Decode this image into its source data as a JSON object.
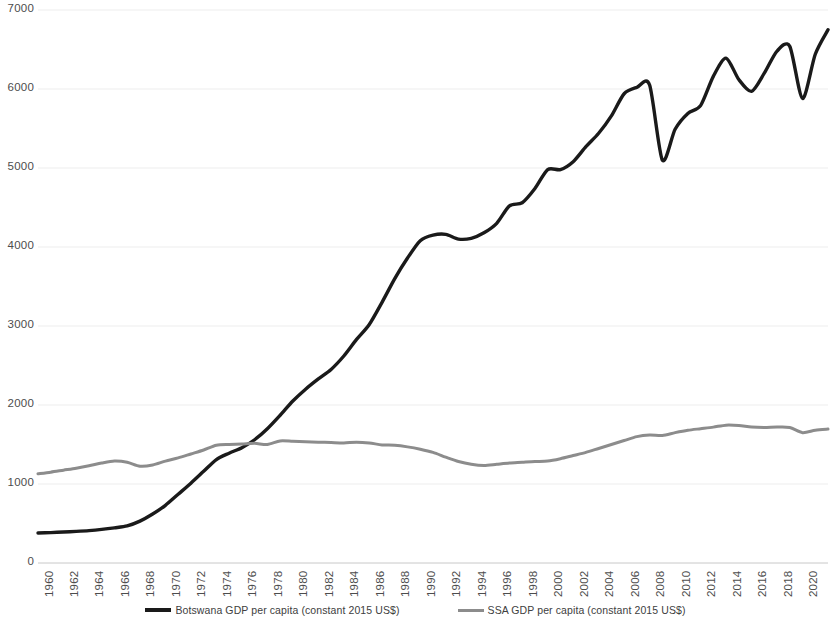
{
  "chart_data": {
    "type": "line",
    "title": "",
    "xlabel": "",
    "ylabel": "",
    "xlim": [
      1960,
      2022
    ],
    "ylim": [
      0,
      7000
    ],
    "grid": true,
    "legend_position": "bottom",
    "yticks": [
      0,
      1000,
      2000,
      3000,
      4000,
      5000,
      6000,
      7000
    ],
    "ytick_labels": [
      "0",
      "1000",
      "2000",
      "3000",
      "4000",
      "5000",
      "6000",
      "7000"
    ],
    "xticks": [
      1960,
      1962,
      1964,
      1966,
      1968,
      1970,
      1972,
      1974,
      1976,
      1978,
      1980,
      1982,
      1984,
      1986,
      1988,
      1990,
      1992,
      1994,
      1996,
      1998,
      2000,
      2002,
      2004,
      2006,
      2008,
      2010,
      2012,
      2014,
      2016,
      2018,
      2020,
      2022
    ],
    "xtick_labels": [
      "1960",
      "1962",
      "1964",
      "1966",
      "1968",
      "1970",
      "1972",
      "1974",
      "1976",
      "1978",
      "1980",
      "1982",
      "1984",
      "1986",
      "1988",
      "1990",
      "1992",
      "1994",
      "1996",
      "1998",
      "2000",
      "2002",
      "2004",
      "2006",
      "2008",
      "2010",
      "2012",
      "2014",
      "2016",
      "2018",
      "2020",
      "2022"
    ],
    "x": [
      1960,
      1961,
      1962,
      1963,
      1964,
      1965,
      1966,
      1967,
      1968,
      1969,
      1970,
      1971,
      1972,
      1973,
      1974,
      1975,
      1976,
      1977,
      1978,
      1979,
      1980,
      1981,
      1982,
      1983,
      1984,
      1985,
      1986,
      1987,
      1988,
      1989,
      1990,
      1991,
      1992,
      1993,
      1994,
      1995,
      1996,
      1997,
      1998,
      1999,
      2000,
      2001,
      2002,
      2003,
      2004,
      2005,
      2006,
      2007,
      2008,
      2009,
      2010,
      2011,
      2012,
      2013,
      2014,
      2015,
      2016,
      2017,
      2018,
      2019,
      2020,
      2021,
      2022
    ],
    "series": [
      {
        "name": "Botswana GDP per capita (constant 2015 US$)",
        "color": "#1a1a1a",
        "width": 3.4,
        "values": [
          380,
          385,
          392,
          400,
          410,
          425,
          445,
          470,
          530,
          620,
          730,
          870,
          1010,
          1160,
          1310,
          1390,
          1460,
          1560,
          1700,
          1870,
          2050,
          2200,
          2330,
          2450,
          2620,
          2830,
          3020,
          3300,
          3600,
          3860,
          4080,
          4150,
          4160,
          4100,
          4110,
          4180,
          4300,
          4520,
          4560,
          4740,
          4980,
          4980,
          5080,
          5270,
          5440,
          5660,
          5940,
          6020,
          6050,
          5100,
          5490,
          5690,
          5790,
          6160,
          6390,
          6120,
          5970,
          6200,
          6480,
          6540,
          5880,
          6440,
          6750
        ]
      },
      {
        "name": "SSA GDP per capita (constant 2015 US$)",
        "color": "#8c8c8c",
        "width": 3.0,
        "values": [
          1130,
          1150,
          1175,
          1200,
          1230,
          1265,
          1290,
          1275,
          1225,
          1240,
          1290,
          1330,
          1380,
          1430,
          1490,
          1500,
          1505,
          1515,
          1500,
          1545,
          1540,
          1535,
          1530,
          1525,
          1520,
          1530,
          1520,
          1495,
          1490,
          1470,
          1440,
          1400,
          1340,
          1285,
          1250,
          1235,
          1250,
          1265,
          1275,
          1285,
          1290,
          1320,
          1360,
          1400,
          1450,
          1500,
          1550,
          1600,
          1620,
          1615,
          1650,
          1680,
          1700,
          1720,
          1745,
          1740,
          1720,
          1715,
          1720,
          1715,
          1650,
          1680,
          1695
        ]
      }
    ]
  },
  "legend": {
    "entries": [
      {
        "label": "Botswana GDP per capita (constant 2015 US$)"
      },
      {
        "label": "SSA GDP per capita (constant 2015 US$)"
      }
    ]
  }
}
